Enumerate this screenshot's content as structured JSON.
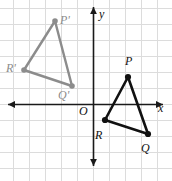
{
  "figure": {
    "background_color": "#ffffff",
    "grid_color": "#dcdcdc",
    "axis_color": "#1a1a1a",
    "preimage_color": "#8c8c8c",
    "image_color": "#111111",
    "width": 172,
    "height": 181,
    "grid_spacing_px": 16,
    "origin_px": {
      "x": 93,
      "y": 104
    }
  },
  "axes": {
    "x_axis_label": "x",
    "y_axis_label": "y",
    "origin_label": "O",
    "x_axis_label_pos": {
      "x": 158,
      "y": 112
    },
    "y_axis_label_pos": {
      "x": 99,
      "y": 18
    },
    "origin_label_pos": {
      "x": 79,
      "y": 115
    },
    "x_axis_y_px": 104,
    "y_axis_x_px": 93,
    "x_axis_start_px": 8,
    "x_axis_end_px": 163,
    "y_axis_start_px": 7,
    "y_axis_end_px": 166
  },
  "chart_data": {
    "type": "scatter",
    "xlabel": "x",
    "ylabel": "y",
    "grid": true,
    "legend": "none",
    "xlim": [
      -5.8,
      4.9
    ],
    "ylim": [
      -3.9,
      6.1
    ],
    "series": [
      {
        "name": "Triangle P'Q'R' (image, gray)",
        "color": "#8c8c8c",
        "closed": true,
        "points": [
          {
            "label": "P'",
            "x": -2.4,
            "y": 5.2,
            "px": 55,
            "py": 21,
            "label_px": 60,
            "label_py": 14
          },
          {
            "label": "Q'",
            "x": -1.3,
            "y": 1.1,
            "px": 72,
            "py": 86,
            "label_px": 58,
            "label_py": 89
          },
          {
            "label": "R'",
            "x": -4.3,
            "y": 2.1,
            "px": 24,
            "py": 70,
            "label_px": 6,
            "label_py": 62
          }
        ]
      },
      {
        "name": "Triangle PQR (preimage, black)",
        "color": "#111111",
        "closed": true,
        "points": [
          {
            "label": "P",
            "x": 2.2,
            "y": 1.7,
            "px": 128,
            "py": 77,
            "label_px": 125,
            "label_py": 55
          },
          {
            "label": "Q",
            "x": 3.4,
            "y": -1.9,
            "px": 148,
            "py": 134,
            "label_px": 141,
            "label_py": 142
          },
          {
            "label": "R",
            "x": 0.75,
            "y": -1.0,
            "px": 105,
            "py": 120,
            "label_px": 95,
            "label_py": 129
          }
        ]
      }
    ]
  },
  "labels": {
    "p_prime": "P'",
    "q_prime": "Q'",
    "r_prime": "R'",
    "p": "P",
    "q": "Q",
    "r": "R",
    "origin": "O",
    "x": "x",
    "y": "y"
  }
}
